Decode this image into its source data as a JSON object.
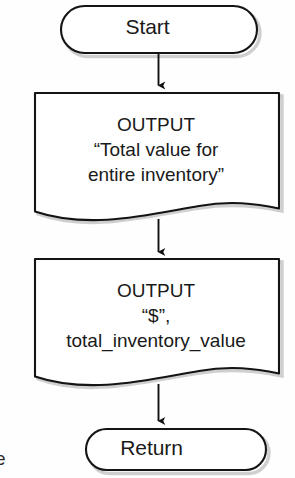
{
  "diagram": {
    "type": "flowchart",
    "stroke_color": "#1a1a1a",
    "fill_color": "#ffffff",
    "shadow_color": "#b9b9b9",
    "nodes": [
      {
        "id": "start",
        "shape": "terminator",
        "label": "Start"
      },
      {
        "id": "output_total_value",
        "shape": "document",
        "lines": [
          "OUTPUT",
          "“Total value for",
          "entire inventory”"
        ]
      },
      {
        "id": "output_dollar_value",
        "shape": "document",
        "lines": [
          "OUTPUT",
          "“$”,",
          "total_inventory_value"
        ]
      },
      {
        "id": "return",
        "shape": "terminator",
        "label": "Return"
      }
    ],
    "edges": [
      {
        "from": "start",
        "to": "output_total_value",
        "arrow": "down"
      },
      {
        "from": "output_total_value",
        "to": "output_dollar_value",
        "arrow": "down"
      },
      {
        "from": "output_dollar_value",
        "to": "return",
        "arrow": "down"
      }
    ]
  },
  "margin_artifact": {
    "text": "e"
  }
}
